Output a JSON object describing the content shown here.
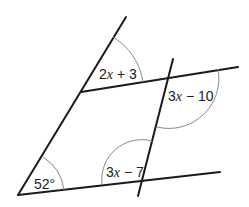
{
  "diagram": {
    "angles": [
      {
        "id": "top-left-angle",
        "label": "2x + 3",
        "parts": [
          "2",
          "x",
          " + 3"
        ]
      },
      {
        "id": "right-angle",
        "label": "3x − 10",
        "parts": [
          "3",
          "x",
          " − 10"
        ]
      },
      {
        "id": "bottom-middle-angle",
        "label": "3x − 7",
        "parts": [
          "3",
          "x",
          " − 7"
        ]
      },
      {
        "id": "bottom-left-angle",
        "label": "52°",
        "parts": [
          "52°"
        ]
      }
    ],
    "colors": {
      "line": "#1a1a1a",
      "arc": "#8a8a8a",
      "text": "#222222"
    }
  }
}
